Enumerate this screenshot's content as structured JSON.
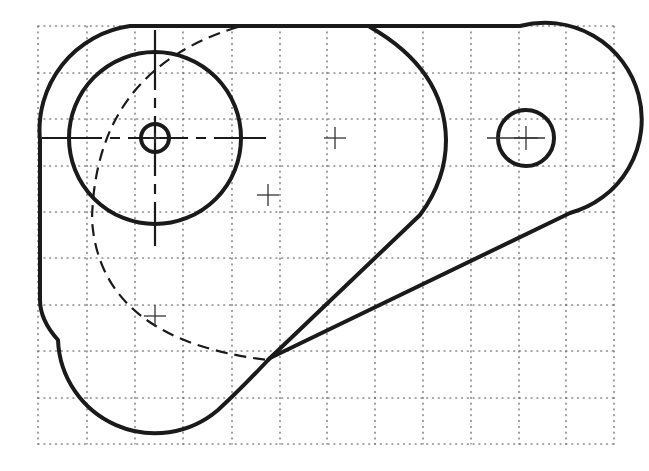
{
  "drawing": {
    "type": "mechanical-part-sketch",
    "colors": {
      "ink": "#1a1a1a",
      "grid": "#555555",
      "background": "#ffffff"
    },
    "grid": {
      "style": "dotted",
      "x_lines": [
        38,
        87,
        135,
        183,
        232,
        280,
        327,
        375,
        423,
        471,
        519,
        566,
        614
      ],
      "y_lines": [
        26,
        73,
        119,
        166,
        212,
        258,
        305,
        351,
        398,
        444
      ]
    },
    "outer_boundary": {
      "path": "M 130 26 L 520 26 A 88 88 0 0 1 570 213 L 270 358 Q 240 390 218 410 A 97 97 0 0 1 58 340 Q 40 320 40 300 L 40 140 A 105 105 0 0 1 130 26 Z"
    },
    "inner_loop": {
      "path": "M 370 27 Q 445 70 446 140 Q 446 180 420 215 L 268 360"
    },
    "hidden_arc": {
      "path": "M 238 27 Q 95 70 92 220 Q 100 340 268 360"
    },
    "large_circle": {
      "cx": 155,
      "cy": 138,
      "r": 86
    },
    "small_circle": {
      "cx": 155,
      "cy": 138,
      "r": 14
    },
    "right_hole": {
      "cx": 526,
      "cy": 138,
      "r": 28
    },
    "centerlines": {
      "horizontal": {
        "x1": 42,
        "y1": 138,
        "x2": 266,
        "y2": 138
      },
      "vertical": {
        "x1": 155,
        "y1": 30,
        "x2": 155,
        "y2": 246
      },
      "right_hole_horizontal": {
        "x1": 487,
        "y1": 138,
        "x2": 545,
        "y2": 138
      }
    },
    "cross_marks": [
      {
        "name": "center-mark-large-circle",
        "x": 155,
        "y": 138,
        "size": 5
      },
      {
        "name": "reference-mark-mid-top",
        "x": 335,
        "y": 138,
        "size": 11
      },
      {
        "name": "reference-mark-mid",
        "x": 268,
        "y": 195,
        "size": 11
      },
      {
        "name": "reference-mark-lower-left",
        "x": 155,
        "y": 316,
        "size": 11
      },
      {
        "name": "center-mark-right-hole",
        "x": 526,
        "y": 138,
        "size": 12
      }
    ]
  }
}
